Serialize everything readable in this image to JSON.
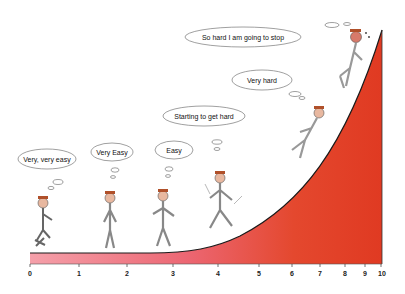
{
  "axis": {
    "ticks": [
      "0",
      "1",
      "2",
      "3",
      "4",
      "5",
      "6",
      "7",
      "8",
      "9",
      "10"
    ],
    "tick_x": [
      30,
      79,
      127,
      173,
      218,
      259,
      292,
      320,
      345,
      365,
      381
    ]
  },
  "thoughts": [
    {
      "text": "Very, very easy"
    },
    {
      "text": "Very Easy"
    },
    {
      "text": "Easy"
    },
    {
      "text": "Starting to get hard"
    },
    {
      "text": "Very hard"
    },
    {
      "text": "So hard I am going to stop"
    }
  ],
  "colors": {
    "fill_light": "#f08a96",
    "fill_dark": "#e4442a",
    "curve": "#1a1a1a"
  }
}
